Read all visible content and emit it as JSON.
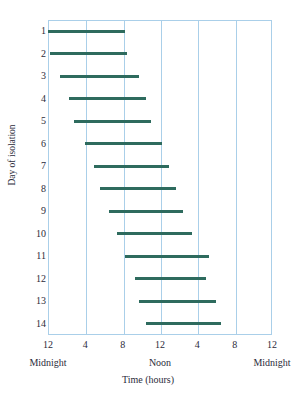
{
  "chart_data": {
    "type": "bar",
    "title": "",
    "subtitle": "",
    "xlabel": "Time (hours)",
    "ylabel": "Day of isolation",
    "orientation": "horizontal",
    "bar_style": "range-bar",
    "grid": true,
    "grid_axis": "x",
    "legend": "none",
    "xlim": [
      0,
      24
    ],
    "ylim": [
      0.5,
      14.5
    ],
    "x_tick_values": [
      0,
      4,
      8,
      12,
      16,
      20,
      24
    ],
    "x_tick_labels": [
      "12",
      "4",
      "8",
      "12",
      "4",
      "8",
      "12"
    ],
    "x_band_labels": [
      {
        "label": "Midnight",
        "at": 0
      },
      {
        "label": "Noon",
        "at": 12
      },
      {
        "label": "Midnight",
        "at": 24
      }
    ],
    "categories": [
      "1",
      "2",
      "3",
      "4",
      "5",
      "6",
      "7",
      "8",
      "9",
      "10",
      "11",
      "12",
      "13",
      "14"
    ],
    "y_tick_labels": [
      "1",
      "2",
      "3",
      "4",
      "5",
      "6",
      "7",
      "8",
      "9",
      "10",
      "11",
      "12",
      "13",
      "14"
    ],
    "series": [
      {
        "name": "Sleep period",
        "color": "#2e6b5e",
        "values": [
          {
            "day": 1,
            "start": 0.0,
            "end": 8.2
          },
          {
            "day": 2,
            "start": 0.2,
            "end": 8.5
          },
          {
            "day": 3,
            "start": 1.3,
            "end": 9.7
          },
          {
            "day": 4,
            "start": 2.2,
            "end": 10.5
          },
          {
            "day": 5,
            "start": 2.8,
            "end": 11.0
          },
          {
            "day": 6,
            "start": 4.0,
            "end": 12.2
          },
          {
            "day": 7,
            "start": 4.9,
            "end": 13.0
          },
          {
            "day": 8,
            "start": 5.6,
            "end": 13.7
          },
          {
            "day": 9,
            "start": 6.5,
            "end": 14.5
          },
          {
            "day": 10,
            "start": 7.4,
            "end": 15.4
          },
          {
            "day": 11,
            "start": 8.3,
            "end": 17.2
          },
          {
            "day": 12,
            "start": 9.3,
            "end": 16.9
          },
          {
            "day": 13,
            "start": 9.7,
            "end": 18.0
          },
          {
            "day": 14,
            "start": 10.5,
            "end": 18.5
          }
        ]
      }
    ],
    "colors": {
      "bar": "#2e6b5e",
      "grid": "#aacfe9",
      "frame": "#aacfe9",
      "text": "#2b2b3a",
      "background": "#ffffff"
    }
  }
}
